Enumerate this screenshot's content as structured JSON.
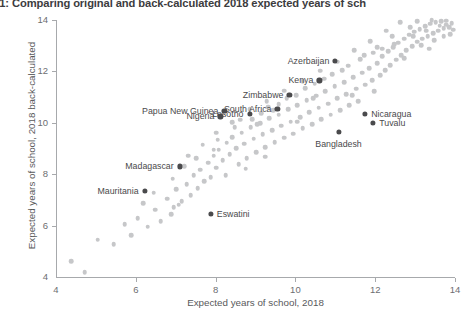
{
  "figure": {
    "title": "ure C2.1: Comparing original and back-calculated 2018 expected years of sch",
    "title_full": "Figure C2.1: Comparing original and back-calculated 2018 expected years of school"
  },
  "chart_data": {
    "type": "scatter",
    "title": "ure C2.1: Comparing original and back-calculated 2018 expected years of sch",
    "xlabel": "Expected years of school, 2018",
    "ylabel": "Expected years of school, 2018 back-calculated",
    "xlim": [
      4,
      14
    ],
    "ylim": [
      4,
      14
    ],
    "xticks": [
      4,
      6,
      8,
      10,
      12,
      14
    ],
    "yticks": [
      4,
      6,
      8,
      10,
      12,
      14
    ],
    "xtick_labels": [
      "4",
      "6",
      "8",
      "10",
      "12",
      "14"
    ],
    "ytick_labels": [
      "4",
      "6",
      "8",
      "10",
      "12",
      "14"
    ],
    "grid": false,
    "legend": null,
    "colors": {
      "background_points": "#c6c7c9",
      "highlight_points": "#4a4a4c",
      "axis": "#a7a9ac",
      "text": "#58595b"
    },
    "highlighted": [
      {
        "label": "Mauritania",
        "x": 6.22,
        "y": 7.35,
        "label_side": "left"
      },
      {
        "label": "Madagascar",
        "x": 7.1,
        "y": 8.3,
        "label_side": "left"
      },
      {
        "label": "Eswatini",
        "x": 7.88,
        "y": 6.45,
        "label_side": "right"
      },
      {
        "label": "Nigeria",
        "x": 8.12,
        "y": 10.25,
        "label_side": "left"
      },
      {
        "label": "Papua New Guinea",
        "x": 8.22,
        "y": 10.45,
        "label_side": "left"
      },
      {
        "label": "Lesotho",
        "x": 8.85,
        "y": 10.35,
        "label_side": "left"
      },
      {
        "label": "South Africa",
        "x": 9.55,
        "y": 10.55,
        "label_side": "left"
      },
      {
        "label": "Zimbabwe",
        "x": 9.85,
        "y": 11.1,
        "label_side": "left"
      },
      {
        "label": "Kenya",
        "x": 10.6,
        "y": 11.65,
        "label_side": "left"
      },
      {
        "label": "Azerbaijan",
        "x": 11.0,
        "y": 12.4,
        "label_side": "left"
      },
      {
        "label": "Bangladesh",
        "x": 11.1,
        "y": 9.65,
        "label_side": "below"
      },
      {
        "label": "Nicaragua",
        "x": 11.75,
        "y": 10.35,
        "label_side": "right"
      },
      {
        "label": "Tuvalu",
        "x": 11.95,
        "y": 10.0,
        "label_side": "right"
      }
    ],
    "points": [
      [
        4.38,
        4.62
      ],
      [
        4.72,
        4.18
      ],
      [
        5.05,
        5.45
      ],
      [
        5.45,
        5.28
      ],
      [
        5.72,
        6.05
      ],
      [
        5.88,
        5.62
      ],
      [
        6.05,
        6.28
      ],
      [
        6.3,
        5.95
      ],
      [
        6.48,
        6.62
      ],
      [
        6.62,
        6.18
      ],
      [
        6.78,
        7.05
      ],
      [
        6.95,
        6.72
      ],
      [
        7.02,
        7.42
      ],
      [
        7.15,
        6.95
      ],
      [
        7.28,
        7.62
      ],
      [
        7.38,
        7.18
      ],
      [
        7.45,
        7.95
      ],
      [
        7.55,
        7.45
      ],
      [
        7.62,
        8.18
      ],
      [
        7.72,
        7.72
      ],
      [
        7.82,
        8.45
      ],
      [
        7.88,
        7.88
      ],
      [
        7.95,
        8.72
      ],
      [
        8.02,
        8.25
      ],
      [
        8.08,
        8.95
      ],
      [
        8.18,
        8.55
      ],
      [
        8.28,
        9.22
      ],
      [
        8.35,
        8.78
      ],
      [
        8.42,
        9.45
      ],
      [
        8.52,
        9.02
      ],
      [
        8.58,
        8.38
      ],
      [
        8.65,
        9.62
      ],
      [
        8.72,
        9.18
      ],
      [
        8.78,
        8.62
      ],
      [
        8.88,
        9.82
      ],
      [
        8.95,
        9.38
      ],
      [
        9.02,
        8.85
      ],
      [
        9.12,
        9.98
      ],
      [
        9.18,
        9.55
      ],
      [
        9.25,
        9.05
      ],
      [
        9.35,
        10.18
      ],
      [
        9.42,
        9.72
      ],
      [
        9.48,
        9.25
      ],
      [
        9.58,
        10.32
      ],
      [
        9.65,
        9.88
      ],
      [
        9.72,
        9.42
      ],
      [
        9.82,
        10.52
      ],
      [
        9.88,
        10.05
      ],
      [
        9.95,
        9.58
      ],
      [
        10.05,
        10.68
      ],
      [
        10.12,
        10.22
      ],
      [
        10.18,
        9.78
      ],
      [
        10.28,
        10.88
      ],
      [
        10.35,
        10.42
      ],
      [
        10.42,
        9.95
      ],
      [
        10.52,
        11.05
      ],
      [
        10.58,
        10.58
      ],
      [
        10.65,
        10.15
      ],
      [
        10.75,
        11.22
      ],
      [
        10.82,
        10.75
      ],
      [
        10.88,
        10.32
      ],
      [
        10.98,
        11.42
      ],
      [
        11.05,
        10.95
      ],
      [
        11.12,
        10.48
      ],
      [
        11.22,
        11.58
      ],
      [
        11.28,
        11.12
      ],
      [
        11.35,
        10.68
      ],
      [
        11.45,
        11.78
      ],
      [
        11.52,
        11.32
      ],
      [
        11.58,
        10.85
      ],
      [
        11.68,
        11.95
      ],
      [
        11.75,
        11.48
      ],
      [
        11.85,
        12.12
      ],
      [
        11.92,
        11.65
      ],
      [
        11.98,
        11.22
      ],
      [
        12.05,
        12.32
      ],
      [
        12.12,
        11.85
      ],
      [
        12.18,
        12.58
      ],
      [
        12.25,
        12.05
      ],
      [
        12.32,
        12.78
      ],
      [
        12.38,
        12.25
      ],
      [
        12.45,
        12.95
      ],
      [
        12.52,
        12.45
      ],
      [
        12.58,
        13.12
      ],
      [
        12.65,
        12.62
      ],
      [
        12.72,
        13.28
      ],
      [
        12.78,
        12.82
      ],
      [
        12.85,
        13.42
      ],
      [
        12.92,
        12.98
      ],
      [
        12.98,
        13.55
      ],
      [
        13.05,
        13.15
      ],
      [
        13.12,
        13.65
      ],
      [
        13.18,
        13.28
      ],
      [
        13.25,
        13.75
      ],
      [
        13.32,
        13.38
      ],
      [
        13.38,
        13.85
      ],
      [
        13.45,
        13.48
      ],
      [
        13.52,
        13.92
      ],
      [
        13.58,
        13.58
      ],
      [
        13.65,
        13.95
      ],
      [
        13.72,
        13.68
      ],
      [
        13.78,
        13.82
      ],
      [
        13.85,
        13.72
      ],
      [
        13.92,
        13.88
      ],
      [
        13.95,
        13.62
      ],
      [
        13.78,
        13.98
      ],
      [
        12.88,
        13.72
      ],
      [
        12.42,
        13.38
      ],
      [
        12.05,
        12.95
      ],
      [
        11.62,
        12.48
      ],
      [
        11.18,
        12.05
      ],
      [
        10.72,
        11.72
      ],
      [
        10.25,
        11.35
      ],
      [
        9.78,
        10.95
      ],
      [
        9.32,
        10.62
      ],
      [
        8.92,
        10.15
      ],
      [
        8.48,
        9.82
      ],
      [
        8.05,
        9.35
      ],
      [
        12.62,
        13.92
      ],
      [
        13.05,
        13.95
      ],
      [
        13.42,
        14.0
      ],
      [
        12.28,
        13.58
      ],
      [
        11.88,
        13.18
      ],
      [
        11.48,
        12.82
      ],
      [
        11.05,
        12.38
      ],
      [
        10.62,
        12.02
      ],
      [
        10.18,
        11.62
      ],
      [
        9.72,
        11.25
      ],
      [
        9.28,
        10.85
      ],
      [
        8.85,
        10.52
      ],
      [
        8.42,
        10.02
      ],
      [
        8.02,
        9.62
      ],
      [
        7.68,
        9.15
      ],
      [
        7.32,
        8.72
      ],
      [
        12.95,
        13.38
      ],
      [
        13.28,
        13.58
      ],
      [
        13.62,
        13.78
      ],
      [
        13.88,
        13.45
      ],
      [
        12.18,
        12.88
      ],
      [
        11.72,
        12.62
      ],
      [
        11.32,
        12.22
      ],
      [
        10.92,
        11.88
      ],
      [
        10.48,
        11.52
      ],
      [
        10.02,
        11.08
      ],
      [
        9.58,
        10.72
      ],
      [
        9.15,
        10.38
      ],
      [
        6.88,
        6.45
      ],
      [
        7.08,
        6.82
      ],
      [
        6.45,
        7.28
      ],
      [
        6.18,
        6.88
      ],
      [
        7.52,
        8.62
      ],
      [
        7.22,
        8.32
      ],
      [
        6.92,
        7.82
      ],
      [
        8.62,
        10.12
      ],
      [
        9.05,
        9.95
      ],
      [
        9.45,
        10.48
      ],
      [
        10.05,
        10.05
      ],
      [
        10.45,
        10.95
      ],
      [
        11.42,
        11.08
      ],
      [
        11.95,
        12.72
      ],
      [
        12.48,
        13.05
      ],
      [
        12.72,
        12.52
      ],
      [
        13.15,
        13.02
      ],
      [
        13.48,
        13.22
      ],
      [
        13.72,
        13.38
      ],
      [
        13.35,
        12.88
      ],
      [
        8.25,
        7.95
      ],
      [
        8.75,
        8.22
      ],
      [
        9.25,
        8.68
      ],
      [
        7.95,
        8.95
      ]
    ]
  }
}
